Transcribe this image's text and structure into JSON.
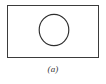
{
  "figure": {
    "caption": "(a)",
    "background_color": "#ffffff",
    "box": {
      "name": "rectangle-outline",
      "stroke_color": "#3b3b3b",
      "fill_color": "#ffffff",
      "stroke_width": 1.7,
      "x": 7,
      "y": 5,
      "width": 92,
      "height": 53
    },
    "circle": {
      "name": "circle-outline",
      "stroke_color": "#2e2e2e",
      "fill": "none",
      "stroke_width": 1.15,
      "center_x": 54,
      "center_y": 30,
      "radius_x": 14.8,
      "radius_y": 15.6
    }
  }
}
